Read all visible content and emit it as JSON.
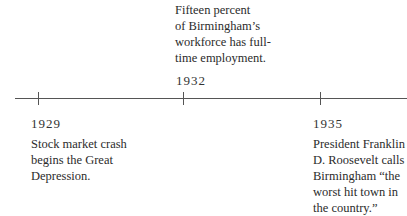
{
  "timeline": {
    "events": [
      {
        "year": "1929",
        "lines": [
          "Stock market crash",
          "begins the Great",
          "Depression."
        ]
      },
      {
        "year": "1932",
        "lines": [
          "Fifteen percent",
          "of Birmingham’s",
          "workforce has full-",
          "time employment."
        ]
      },
      {
        "year": "1935",
        "lines": [
          "President Franklin",
          "D. Roosevelt calls",
          "Birmingham “the",
          "worst hit town in",
          "the country.”"
        ]
      }
    ]
  },
  "colors": {
    "line": "#555555",
    "text": "#2b2b2b",
    "background": "#ffffff"
  }
}
